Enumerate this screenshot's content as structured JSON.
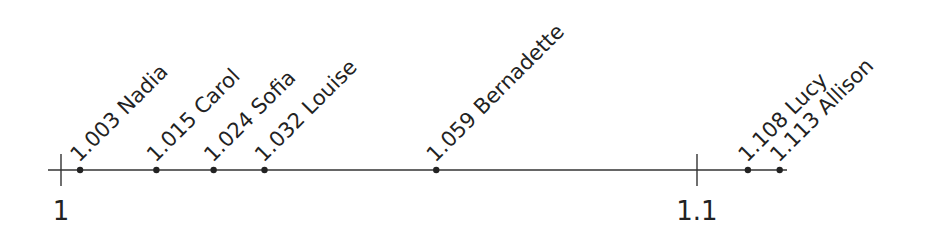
{
  "chart_data": {
    "type": "scatter",
    "title": "",
    "xlabel": "",
    "ylabel": "",
    "xlim": [
      0.998,
      1.116
    ],
    "grid": false,
    "legend": null,
    "ticks": [
      {
        "value": 1,
        "label": "1"
      },
      {
        "value": 1.1,
        "label": "1.1"
      }
    ],
    "points": [
      {
        "value": 1.003,
        "name": "Nadia",
        "label": "1.003 Nadia"
      },
      {
        "value": 1.015,
        "name": "Carol",
        "label": "1.015 Carol"
      },
      {
        "value": 1.024,
        "name": "Sofia",
        "label": "1.024 Sofia"
      },
      {
        "value": 1.032,
        "name": "Louise",
        "label": "1.032 Louise"
      },
      {
        "value": 1.059,
        "name": "Bernadette",
        "label": "1.059 Bernadette"
      },
      {
        "value": 1.108,
        "name": "Lucy",
        "label": "1.108 Lucy"
      },
      {
        "value": 1.113,
        "name": "Allison",
        "label": "1.113 Allison"
      }
    ]
  },
  "colors": {
    "ink": "#222222",
    "background": "#ffffff"
  }
}
